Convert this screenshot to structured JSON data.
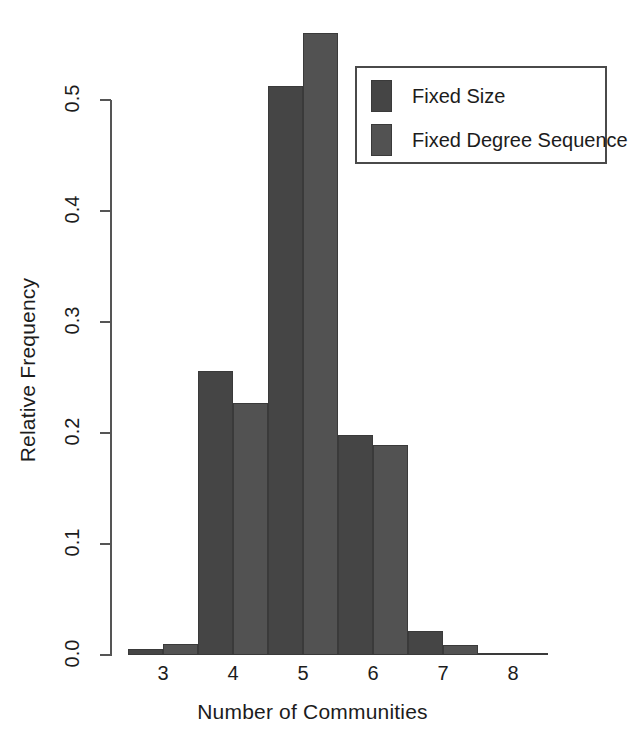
{
  "chart_data": {
    "type": "bar",
    "title": "",
    "xlabel": "Number of Communities",
    "ylabel": "Relative Frequency",
    "categories": [
      "3",
      "4",
      "5",
      "6",
      "7",
      "8"
    ],
    "series": [
      {
        "name": "Fixed Size",
        "color": "#454545",
        "values": [
          0.005,
          0.256,
          0.513,
          0.198,
          0.022,
          0.001
        ]
      },
      {
        "name": "Fixed Degree Sequence",
        "color": "#525252",
        "values": [
          0.01,
          0.227,
          0.56,
          0.189,
          0.009,
          0.001
        ]
      }
    ],
    "ylim": [
      0.0,
      0.56
    ],
    "yticks": [
      0.0,
      0.1,
      0.2,
      0.3,
      0.4,
      0.5
    ],
    "ytick_labels": [
      "0.0",
      "0.1",
      "0.2",
      "0.3",
      "0.4",
      "0.5"
    ],
    "grid": false,
    "legend_position": "top-right"
  },
  "legend": {
    "entries": [
      {
        "label": "Fixed Size",
        "color": "#454545"
      },
      {
        "label": "Fixed Degree Sequence",
        "color": "#525252"
      }
    ]
  },
  "axes": {
    "x_label": "Number of Communities",
    "y_label": "Relative Frequency",
    "y_tick_labels": [
      "0.0",
      "0.1",
      "0.2",
      "0.3",
      "0.4",
      "0.5"
    ],
    "x_tick_labels": [
      "3",
      "4",
      "5",
      "6",
      "7",
      "8"
    ]
  },
  "colors": {
    "axis": "#555555",
    "text": "#1c1c1c",
    "background": "#ffffff",
    "series_1": "#454545",
    "series_2": "#525252"
  }
}
